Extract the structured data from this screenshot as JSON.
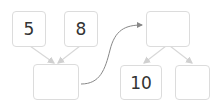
{
  "left_tree": {
    "top_left": {
      "value": "5"
    },
    "top_right": {
      "value": "8"
    },
    "bottom": {
      "value": ""
    }
  },
  "right_tree": {
    "top": {
      "value": ""
    },
    "bottom_left": {
      "value": "10"
    },
    "bottom_right": {
      "value": ""
    }
  },
  "colors": {
    "box_border": "#dcdcdc",
    "arrow": "#d6d6d6",
    "curve": "#888888",
    "text": "#333333"
  }
}
